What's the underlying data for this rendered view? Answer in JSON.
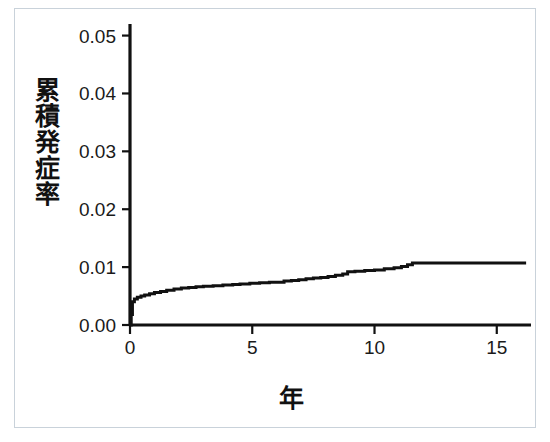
{
  "figure": {
    "background_color": "#ffffff",
    "border_color": "#c9d2da",
    "line_color": "#111111"
  },
  "axes": {
    "y_title_chars": [
      "累",
      "積",
      "発",
      "症",
      "率"
    ],
    "y_title": "累積発症率",
    "x_title": "年",
    "y_ticks": [
      "0.00",
      "0.01",
      "0.02",
      "0.03",
      "0.04",
      "0.05"
    ],
    "x_ticks": [
      "0",
      "5",
      "10",
      "15"
    ]
  },
  "chart_data": {
    "type": "line",
    "title": "",
    "subtitle": "",
    "xlabel": "年",
    "ylabel": "累積発症率",
    "xlim": [
      0,
      16.4
    ],
    "ylim": [
      0.0,
      0.052
    ],
    "xticks": [
      0,
      5,
      10,
      15
    ],
    "yticks": [
      0.0,
      0.01,
      0.02,
      0.03,
      0.04,
      0.05
    ],
    "grid": false,
    "legend": null,
    "step_style": "post",
    "series": [
      {
        "name": "累積発症率",
        "color": "#111111",
        "x": [
          0.0,
          0.05,
          0.1,
          0.18,
          0.3,
          0.45,
          0.6,
          0.8,
          1.0,
          1.25,
          1.5,
          1.8,
          2.1,
          2.4,
          2.7,
          3.0,
          3.4,
          3.8,
          4.2,
          4.5,
          4.9,
          5.3,
          5.7,
          6.0,
          6.3,
          6.6,
          6.9,
          7.2,
          7.5,
          7.8,
          8.1,
          8.4,
          8.7,
          8.9,
          9.2,
          9.6,
          10.0,
          10.4,
          10.8,
          11.1,
          11.35,
          11.55,
          12.0,
          13.0,
          14.0,
          15.0,
          16.2
        ],
        "y": [
          0.0,
          0.0018,
          0.004,
          0.0045,
          0.0048,
          0.005,
          0.0052,
          0.0054,
          0.0056,
          0.0058,
          0.006,
          0.0062,
          0.0064,
          0.0065,
          0.0066,
          0.0067,
          0.0068,
          0.0069,
          0.007,
          0.0071,
          0.0072,
          0.0073,
          0.0074,
          0.0074,
          0.0076,
          0.0077,
          0.0078,
          0.008,
          0.0081,
          0.0082,
          0.0084,
          0.0086,
          0.0088,
          0.0092,
          0.0093,
          0.0094,
          0.0095,
          0.0097,
          0.0099,
          0.0101,
          0.0104,
          0.0107,
          0.0107,
          0.0107,
          0.0107,
          0.0107,
          0.0107
        ]
      }
    ]
  }
}
